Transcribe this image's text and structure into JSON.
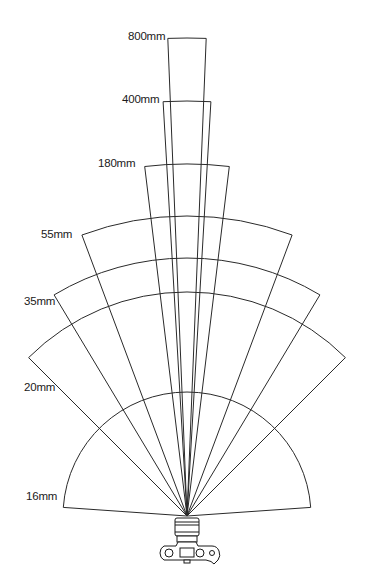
{
  "diagram": {
    "apex": {
      "x": 187,
      "y": 516
    },
    "line_color": "#2a2a2a",
    "focal_lengths": [
      {
        "label": "800mm",
        "radius": 478,
        "half_angle_deg": 2.3,
        "label_x": 128,
        "label_y": 37
      },
      {
        "label": "400mm",
        "radius": 415,
        "half_angle_deg": 3.3,
        "label_x": 122,
        "label_y": 100
      },
      {
        "label": "180mm",
        "radius": 352,
        "half_angle_deg": 6.9,
        "label_x": 98,
        "label_y": 164
      },
      {
        "label": "55mm",
        "radius": 300,
        "half_angle_deg": 20.5,
        "label_x": 41,
        "label_y": 235
      },
      {
        "label": "35mm",
        "radius": 258,
        "half_angle_deg": 31,
        "label_x": 24,
        "label_y": 302
      },
      {
        "label": "20mm",
        "radius": 224,
        "half_angle_deg": 45,
        "label_x": 24,
        "label_y": 388
      },
      {
        "label": "16mm",
        "radius": 124,
        "half_angle_deg": 86,
        "label_x": 26,
        "label_y": 497
      }
    ],
    "camera_icon": "camera-top-view-icon"
  }
}
